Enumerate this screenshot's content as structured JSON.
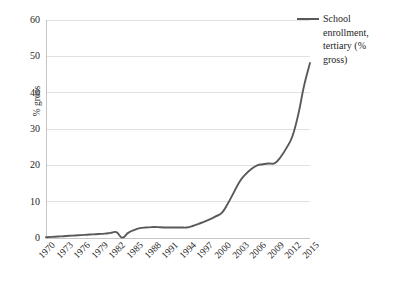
{
  "chart_data": {
    "type": "line",
    "title": "",
    "xlabel": "",
    "ylabel": "% gross",
    "ylim": [
      0,
      60
    ],
    "ytick_step": 10,
    "yticks": [
      60,
      50,
      40,
      30,
      20,
      10,
      0
    ],
    "grid": true,
    "legend_position": "right",
    "series": [
      {
        "name": "School enrollment, tertiary (% gross)",
        "color": "#595959",
        "x": [
          1970,
          1971,
          1972,
          1973,
          1974,
          1975,
          1976,
          1977,
          1978,
          1979,
          1980,
          1981,
          1982,
          1983,
          1984,
          1985,
          1986,
          1987,
          1988,
          1989,
          1990,
          1991,
          1992,
          1993,
          1994,
          1995,
          1996,
          1997,
          1998,
          1999,
          2000,
          2001,
          2002,
          2003,
          2004,
          2005,
          2006,
          2007,
          2008,
          2009,
          2010,
          2011,
          2012,
          2013,
          2014,
          2015
        ],
        "values": [
          0.2,
          0.3,
          0.4,
          0.5,
          0.6,
          0.7,
          0.8,
          0.9,
          1.0,
          1.1,
          1.2,
          1.4,
          1.6,
          0.1,
          1.4,
          2.2,
          2.7,
          2.9,
          3.0,
          3.0,
          2.9,
          2.9,
          2.9,
          2.9,
          2.9,
          3.3,
          3.9,
          4.5,
          5.2,
          6.0,
          7.0,
          9.5,
          12.5,
          15.5,
          17.5,
          19.0,
          20.0,
          20.3,
          20.5,
          20.6,
          22.3,
          24.8,
          28.0,
          34.0,
          42.0,
          48.2
        ]
      }
    ],
    "xticks": [
      "1970",
      "1973",
      "1976",
      "1979",
      "1982",
      "1985",
      "1988",
      "1991",
      "1994",
      "1997",
      "2000",
      "2003",
      "2006",
      "2009",
      "2012",
      "2015"
    ]
  },
  "legend": {
    "label": "School enrollment, tertiary (% gross)"
  },
  "colors": {
    "series": "#595959",
    "gridline": "#d9d9d9",
    "axis": "#bfbfbf",
    "text": "#262626"
  }
}
